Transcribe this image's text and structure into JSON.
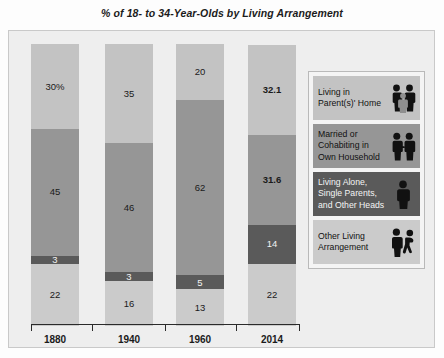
{
  "chart_data": {
    "type": "bar",
    "subtype": "stacked-bar-100",
    "title": "% of 18- to 34-Year-Olds by Living Arrangement",
    "xlabel": "",
    "ylabel": "",
    "ylim": [
      0,
      100
    ],
    "grid": false,
    "legend_position": "right",
    "categories": [
      "1880",
      "1940",
      "1960",
      "2014"
    ],
    "series": [
      {
        "name": "Living in Parent(s)' Home",
        "color": "#c3c3c3",
        "values": [
          30,
          35,
          20,
          32.1
        ],
        "labels": [
          "30%",
          "35",
          "20",
          "32.1"
        ],
        "label_bold": [
          false,
          false,
          false,
          true
        ],
        "label_on_dark": [
          false,
          false,
          false,
          false
        ]
      },
      {
        "name": "Married or Cohabiting in Own Household",
        "color": "#969696",
        "values": [
          45,
          46,
          62,
          31.6
        ],
        "labels": [
          "45",
          "46",
          "62",
          "31.6"
        ],
        "label_bold": [
          false,
          false,
          false,
          true
        ],
        "label_on_dark": [
          false,
          false,
          false,
          false
        ]
      },
      {
        "name": "Living Alone, Single Parents, and Other Heads",
        "color": "#5a5a5a",
        "values": [
          3,
          3,
          5,
          14
        ],
        "labels": [
          "3",
          "3",
          "5",
          "14"
        ],
        "label_bold": [
          false,
          false,
          false,
          false
        ],
        "label_on_dark": [
          true,
          true,
          true,
          true
        ]
      },
      {
        "name": "Other Living Arrangement",
        "color": "#cbcbcb",
        "values": [
          22,
          16,
          13,
          22
        ],
        "labels": [
          "22",
          "16",
          "13",
          "22"
        ],
        "label_bold": [
          false,
          false,
          false,
          false
        ],
        "label_on_dark": [
          false,
          false,
          false,
          false
        ]
      }
    ],
    "stack_order_bottom_to_top": [
      "Other Living Arrangement",
      "Living Alone, Single Parents, and Other Heads",
      "Married or Cohabiting in Own Household",
      "Living in Parent(s)' Home"
    ]
  },
  "axis": {
    "tick_labels": [
      "1880",
      "1940",
      "1960",
      "2014"
    ]
  },
  "legend": {
    "items": [
      {
        "label": "Living in Parent(s)' Home",
        "color": "#c3c3c3",
        "text_color": "dark",
        "icon": "family-three-people-icon"
      },
      {
        "label": "Married or Cohabiting in Own Household",
        "color": "#969696",
        "text_color": "dark",
        "icon": "couple-two-people-icon"
      },
      {
        "label": "Living Alone, Single Parents, and Other Heads",
        "color": "#5a5a5a",
        "text_color": "light",
        "icon": "single-person-icon"
      },
      {
        "label": "Other Living Arrangement",
        "color": "#cbcbcb",
        "text_color": "dark",
        "icon": "two-separate-people-icon"
      }
    ]
  },
  "colors": {
    "parents_home": "#c3c3c3",
    "married": "#969696",
    "living_alone": "#5a5a5a",
    "other": "#cbcbcb",
    "plot_background": "#eeeeee",
    "axis": "#2a2a2a"
  }
}
